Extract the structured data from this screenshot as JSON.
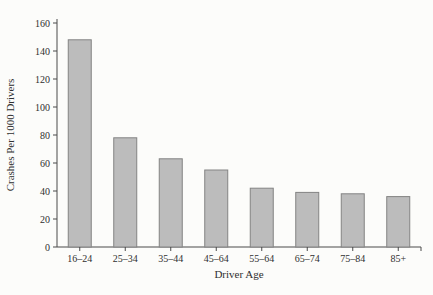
{
  "page": {
    "background": "#fcfcfa",
    "figure_name": "Crashes per 1000 drivers by driver age bar chart"
  },
  "chart_data": {
    "type": "bar",
    "title": "",
    "xlabel": "Driver Age",
    "ylabel": "Crashes Per 1000 Drivers",
    "categories": [
      "16–24",
      "25–34",
      "35–44",
      "45–64",
      "55–64",
      "65–74",
      "75–84",
      "85+"
    ],
    "values": [
      148,
      78,
      63,
      55,
      42,
      39,
      38,
      36
    ],
    "ylim": [
      0,
      160
    ],
    "ytick_step": 20,
    "yticks": [
      0,
      20,
      40,
      60,
      80,
      100,
      120,
      140,
      160
    ],
    "grid": false,
    "legend": "none",
    "colors": {
      "bar_fill": "#bcbcbc",
      "bar_border": "#838383",
      "axis": "#4a4a4a",
      "text": "#2f2f2f",
      "background": "#fcfcfa"
    }
  }
}
